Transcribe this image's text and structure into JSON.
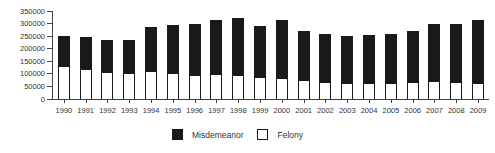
{
  "chart_data": {
    "type": "bar",
    "stacked": true,
    "title": "",
    "xlabel": "",
    "ylabel": "",
    "categories": [
      "1990",
      "1991",
      "1992",
      "1993",
      "1994",
      "1995",
      "1996",
      "1997",
      "1998",
      "1999",
      "2000",
      "2001",
      "2002",
      "2003",
      "2004",
      "2005",
      "2006",
      "2007",
      "2008",
      "2009"
    ],
    "series": [
      {
        "name": "Misdemeanor",
        "color": "#1a1a1a",
        "values": [
          120000,
          128000,
          126000,
          133000,
          176000,
          193000,
          201000,
          216000,
          226000,
          204000,
          230000,
          194000,
          191000,
          186000,
          189000,
          192000,
          204000,
          227000,
          233000,
          249000
        ]
      },
      {
        "name": "Felony",
        "color": "#ffffff",
        "values": [
          130000,
          118000,
          107000,
          102000,
          110000,
          102000,
          96000,
          99000,
          97000,
          86000,
          83000,
          75000,
          68000,
          63000,
          65000,
          65000,
          67000,
          73000,
          67000,
          64000
        ]
      }
    ],
    "ylim": [
      0,
      350000
    ],
    "yticks": [
      0,
      50000,
      100000,
      150000,
      200000,
      250000,
      300000,
      350000
    ],
    "grid": false,
    "legend_position": "bottom-center",
    "axis_color": "#444444",
    "text_color": "#333333"
  }
}
